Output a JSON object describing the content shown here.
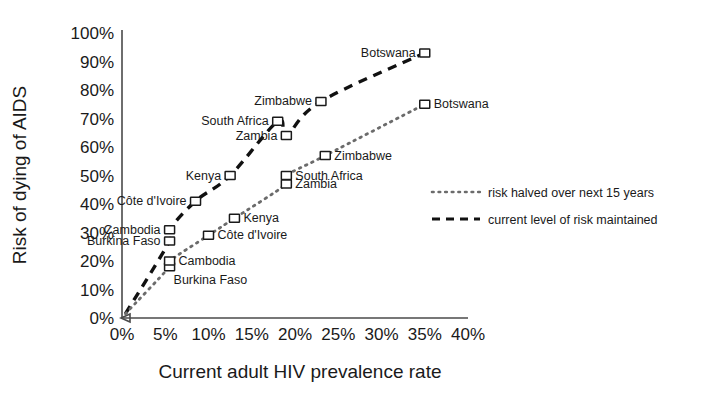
{
  "chart_data": {
    "type": "scatter",
    "title": "",
    "xlabel": "Current adult HIV prevalence rate",
    "ylabel": "Risk of dying of AIDS",
    "xlim": [
      0,
      40
    ],
    "ylim": [
      0,
      100
    ],
    "grid": false,
    "legend_position": "right",
    "x_tick_labels": [
      "0%",
      "5%",
      "10%",
      "15%",
      "20%",
      "25%",
      "30%",
      "35%",
      "40%"
    ],
    "y_tick_labels": [
      "0%",
      "10%",
      "20%",
      "30%",
      "40%",
      "50%",
      "60%",
      "70%",
      "80%",
      "90%",
      "100%"
    ],
    "x_ticks": [
      0,
      5,
      10,
      15,
      20,
      25,
      30,
      35,
      40
    ],
    "y_ticks": [
      0,
      10,
      20,
      30,
      40,
      50,
      60,
      70,
      80,
      90,
      100
    ],
    "series": [
      {
        "name": "current level of risk maintained",
        "style": "dashed",
        "color": "#111111",
        "points": [
          {
            "label": "Burkina Faso",
            "x": 5.5,
            "y": 27,
            "label_pos": "left"
          },
          {
            "label": "Cambodia",
            "x": 5.5,
            "y": 31,
            "label_pos": "left"
          },
          {
            "label": "Côte d'Ivoire",
            "x": 8.5,
            "y": 41,
            "label_pos": "left"
          },
          {
            "label": "Kenya",
            "x": 12.5,
            "y": 50,
            "label_pos": "left"
          },
          {
            "label": "South Africa",
            "x": 18,
            "y": 69,
            "label_pos": "left"
          },
          {
            "label": "Zambia",
            "x": 19,
            "y": 64,
            "label_pos": "left"
          },
          {
            "label": "Zimbabwe",
            "x": 23,
            "y": 76,
            "label_pos": "left"
          },
          {
            "label": "Botswana",
            "x": 35,
            "y": 93,
            "label_pos": "left"
          }
        ]
      },
      {
        "name": "risk halved over next 15 years",
        "style": "dotted",
        "color": "#6b6b6b",
        "points": [
          {
            "label": "Burkina Faso",
            "x": 5.5,
            "y": 18,
            "label_pos": "below"
          },
          {
            "label": "Cambodia",
            "x": 5.5,
            "y": 20,
            "label_pos": "right"
          },
          {
            "label": "Côte d'Ivoire",
            "x": 10,
            "y": 29,
            "label_pos": "right"
          },
          {
            "label": "Kenya",
            "x": 13,
            "y": 35,
            "label_pos": "right"
          },
          {
            "label": "South Africa",
            "x": 19,
            "y": 50,
            "label_pos": "right"
          },
          {
            "label": "Zambia",
            "x": 19,
            "y": 47,
            "label_pos": "right"
          },
          {
            "label": "Zimbabwe",
            "x": 23.5,
            "y": 57,
            "label_pos": "right"
          },
          {
            "label": "Botswana",
            "x": 35,
            "y": 75,
            "label_pos": "right"
          }
        ]
      }
    ],
    "legend": [
      {
        "label": "risk halved over next 15 years",
        "style": "dotted"
      },
      {
        "label": "current level of risk maintained",
        "style": "dashed"
      }
    ]
  }
}
